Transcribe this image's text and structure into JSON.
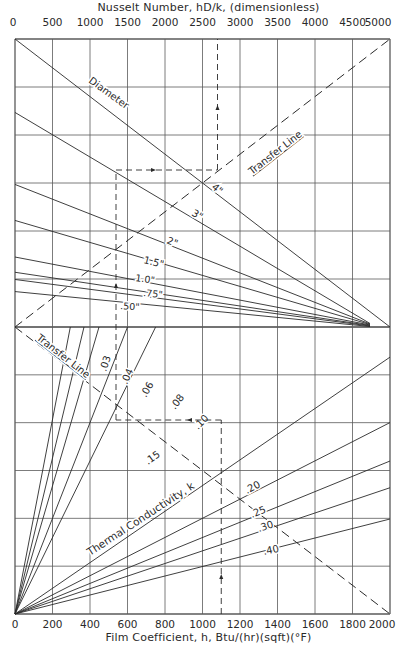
{
  "chart_data": {
    "type": "nomograph",
    "title_top": "Nusselt Number, hD/k, (dimensionless)",
    "title_bottom": "Film Coefficient, h, Btu/(hr)(sqft)(°F)",
    "top_axis": {
      "label": "Nusselt Number, hD/k, (dimensionless)",
      "range": [
        0,
        5000
      ],
      "ticks": [
        0,
        500,
        1000,
        1500,
        2000,
        2500,
        3000,
        3500,
        4000,
        4500,
        5000
      ]
    },
    "bottom_axis": {
      "label": "Film Coefficient, h, Btu/(hr)(sqft)(°F)",
      "range": [
        0,
        2000
      ],
      "ticks": [
        0,
        200,
        400,
        600,
        800,
        1000,
        1200,
        1400,
        1600,
        1800,
        2000
      ]
    },
    "grid": true,
    "upper_section": {
      "label": "Diameter",
      "pivot": "right edge at section midline (Nusselt 5000 side)",
      "lines": [
        {
          "label": "Diameter",
          "left_y_frac": 0.0
        },
        {
          "label": "4\"",
          "left_y_frac": 0.255
        },
        {
          "label": "3\"",
          "left_y_frac": 0.505
        },
        {
          "label": "2\"",
          "left_y_frac": 0.63
        },
        {
          "label": "1.5\"",
          "left_y_frac": 0.757
        },
        {
          "label": "1.0\"",
          "left_y_frac": 0.81
        },
        {
          "label": ".75\"",
          "left_y_frac": 0.835
        },
        {
          "label": ".50\"",
          "left_y_frac": 0.877
        }
      ],
      "transfer_line_label": "Transfer Line"
    },
    "lower_section": {
      "label": "Thermal Conductivity, k",
      "pivot": "origin (bottom-left)",
      "lines": [
        {
          "label": ".03",
          "end": "top",
          "end_x_value": 295
        },
        {
          "label": ".04",
          "end": "top",
          "end_x_value": 368
        },
        {
          "label": ".06",
          "end": "top",
          "end_x_value": 448
        },
        {
          "label": ".08",
          "end": "top",
          "end_x_value": 600
        },
        {
          "label": ".10",
          "end": "top",
          "end_x_value": 750
        },
        {
          "label": ".15",
          "end": "right",
          "end_y_frac": 0.895
        },
        {
          "label": ".20",
          "end": "right",
          "end_y_frac": 0.667
        },
        {
          "label": ".25",
          "end": "right",
          "end_y_frac": 0.533
        },
        {
          "label": ".30",
          "end": "right",
          "end_y_frac": 0.44
        },
        {
          "label": ".40",
          "end": "right",
          "end_y_frac": 0.331
        }
      ],
      "transfer_line_label": "Transfer Line"
    },
    "example_path": {
      "film_coefficient_h": 1100,
      "thermal_conductivity_k": 0.08,
      "diameter": "4\"",
      "nusselt_number": 2700,
      "note": "dashed guide lines with arrows"
    }
  },
  "labels": {
    "diameter": "Diameter",
    "transfer_line_upper": "Transfer Line",
    "transfer_line_lower": "Transfer Line",
    "thermal_conductivity": "Thermal Conductivity, k"
  },
  "colors": {
    "ink": "#2a2a2a",
    "grid": "#5a5a5a",
    "background": "#ffffff"
  }
}
